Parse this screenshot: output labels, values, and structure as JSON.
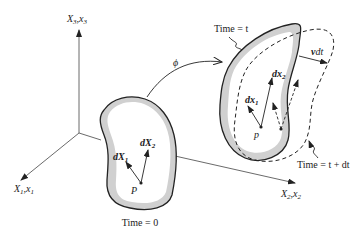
{
  "diagram": {
    "axes": {
      "x3_label": "X",
      "x3_label_sub": "3",
      "x3_label_rest": ",x",
      "x3_label_rest_sub": "3",
      "x1_label": "X",
      "x1_label_sub": "1",
      "x1_label_rest": ",x",
      "x1_label_rest_sub": "1",
      "x2_label": "X",
      "x2_label_sub": "2",
      "x2_label_rest": ",x",
      "x2_label_rest_sub": "2"
    },
    "mapping_label": "ϕ",
    "reference_body": {
      "time_label": "Time = 0",
      "point_label": "P",
      "vector1_label": "dX",
      "vector1_sub": "1",
      "vector2_label": "dX",
      "vector2_sub": "2"
    },
    "current_body": {
      "time_label": "Time = t",
      "point_label": "p",
      "vector1_label": "dx",
      "vector1_sub": "1",
      "vector2_label": "dx",
      "vector2_sub": "2"
    },
    "next_body": {
      "time_label": "Time = t + dt"
    },
    "velocity_label": "v",
    "velocity_label_rest": "dt",
    "colors": {
      "outline": "#222222",
      "shading": "#d0d0d0",
      "background": "#ffffff"
    }
  }
}
